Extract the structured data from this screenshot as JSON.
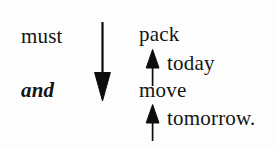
{
  "figure": {
    "background_color": "#fdfdfd",
    "ink_color": "#0d0d0d",
    "width": 278,
    "height": 147
  },
  "left_column": {
    "line1": "must",
    "line2": "and"
  },
  "right_column": {
    "line1": "pack",
    "line2": "today",
    "line3": "move",
    "line4": "tomorrow."
  },
  "arrows": [
    {
      "name": "main-down-arrow",
      "direction": "down",
      "semantic": "connects must to and",
      "color": "#0d0d0d"
    },
    {
      "name": "today-up-arrow",
      "direction": "up",
      "semantic": "today attaches to pack",
      "color": "#0d0d0d"
    },
    {
      "name": "tomorrow-up-arrow",
      "direction": "up",
      "semantic": "tomorrow attaches to move",
      "color": "#0d0d0d"
    }
  ]
}
